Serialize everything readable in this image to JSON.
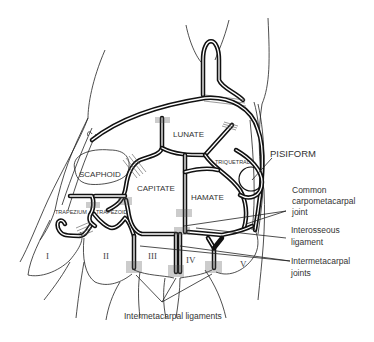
{
  "diagram": {
    "bones": {
      "scaphoid": "SCAPHOID",
      "lunate": "LUNATE",
      "triquetral": "TRIQUETRAL",
      "pisiform": "PISIFORM",
      "capitate": "CAPITATE",
      "hamate": "HAMATE",
      "trapezium": "TRAPEZIUM",
      "trapezoid": "TRAPEZOID"
    },
    "metacarpals": [
      "I",
      "II",
      "III",
      "IV",
      "V"
    ],
    "callouts": {
      "common_cmc_line1": "Common",
      "common_cmc_line2": "carpometacarpal",
      "common_cmc_line3": "joint",
      "interosseous_line1": "Interosseous",
      "interosseous_line2": "ligament",
      "intermetacarpal_joints_line1": "Intermetacarpal",
      "intermetacarpal_joints_line2": "joints",
      "intermetacarpal_ligaments": "Intermetacarpal ligaments"
    }
  }
}
